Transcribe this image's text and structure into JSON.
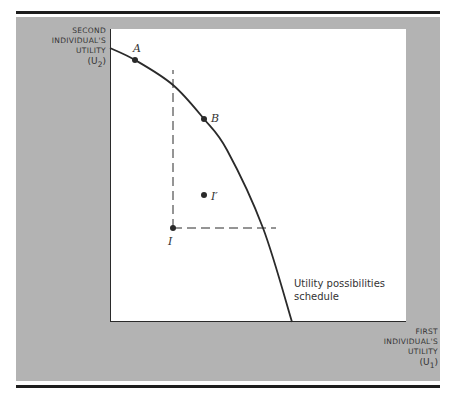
{
  "chart_data": {
    "type": "line",
    "title": "",
    "xlabel": "FIRST INDIVIDUAL'S UTILITY (U1)",
    "ylabel": "SECOND INDIVIDUAL'S UTILITY (U2)",
    "axes": {
      "x_ticks": [],
      "y_ticks": [],
      "grid": false,
      "legend": "none"
    },
    "series": [
      {
        "name": "Utility possibilities schedule",
        "style": "solid concave frontier",
        "points_px": [
          [
            110,
            48
          ],
          [
            135,
            60
          ],
          [
            173,
            85
          ],
          [
            204,
            119
          ],
          [
            227,
            150
          ],
          [
            263,
            228
          ],
          [
            292,
            322
          ]
        ]
      }
    ],
    "points": [
      {
        "label": "A",
        "x": 135,
        "y": 60,
        "on_frontier": true
      },
      {
        "label": "B",
        "x": 204,
        "y": 119,
        "on_frontier": true
      },
      {
        "label": "I'",
        "x": 204,
        "y": 195,
        "on_frontier": false
      },
      {
        "label": "I",
        "x": 173,
        "y": 228,
        "on_frontier": false
      }
    ],
    "reference_lines": [
      {
        "type": "dashed-vertical",
        "from": [
          173,
          228
        ],
        "to": [
          173,
          70
        ]
      },
      {
        "type": "dashed-horizontal",
        "from": [
          173,
          228
        ],
        "to": [
          276,
          228
        ]
      }
    ],
    "annotations": [
      "Utility possibilities schedule"
    ]
  },
  "axis_labels": {
    "y": {
      "line1": "SECOND",
      "line2": "INDIVIDUAL'S",
      "line3": "UTILITY",
      "symbol": "(U",
      "sub": "2",
      "close": ")"
    },
    "x": {
      "line1": "FIRST",
      "line2": "INDIVIDUAL'S",
      "line3": "UTILITY",
      "symbol": "(U",
      "sub": "1",
      "close": ")"
    }
  },
  "labels": {
    "A": "A",
    "B": "B",
    "I_prime": "I′",
    "I": "I",
    "curve_line1": "Utility possibilities",
    "curve_line2": "schedule"
  },
  "colors": {
    "panel": "#b3b3b3",
    "plot_bg": "#ffffff",
    "ink": "#2a2a2a",
    "rule": "#1e1e1e"
  }
}
